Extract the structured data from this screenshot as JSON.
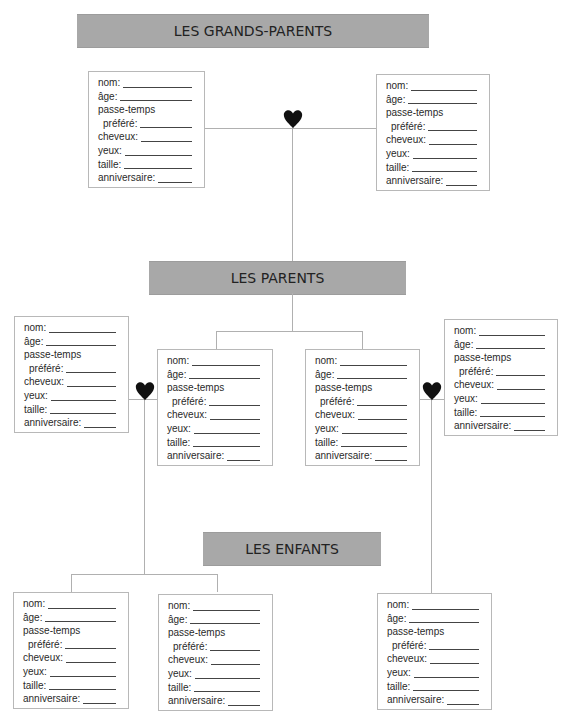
{
  "sections": {
    "grandparents": "LES GRANDS-PARENTS",
    "parents": "LES PARENTS",
    "children": "LES ENFANTS"
  },
  "card_fields": [
    {
      "label": "nom:",
      "blank": true
    },
    {
      "label": "âge:",
      "blank": true
    },
    {
      "label": "passe-temps",
      "blank": false
    },
    {
      "label": "préféré:",
      "blank": true,
      "indent": true
    },
    {
      "label": "cheveux:",
      "blank": true
    },
    {
      "label": "yeux:",
      "blank": true
    },
    {
      "label": "taille:",
      "blank": true
    },
    {
      "label": "anniversaire:",
      "blank": true
    }
  ],
  "cards": [
    {
      "id": "grandparent-left",
      "group": "grandparents"
    },
    {
      "id": "grandparent-right",
      "group": "grandparents"
    },
    {
      "id": "parent-outer-left",
      "group": "parents"
    },
    {
      "id": "parent-inner-left",
      "group": "parents"
    },
    {
      "id": "parent-inner-right",
      "group": "parents"
    },
    {
      "id": "parent-outer-right",
      "group": "parents"
    },
    {
      "id": "child-1",
      "group": "children"
    },
    {
      "id": "child-2",
      "group": "children"
    },
    {
      "id": "child-3",
      "group": "children"
    }
  ],
  "icons": {
    "union": "heart-icon"
  },
  "colors": {
    "banner": "#a8a8a8",
    "line": "#b0b0b0",
    "heart": "#111111"
  }
}
